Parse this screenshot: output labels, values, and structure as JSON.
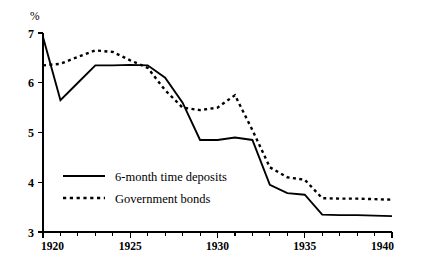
{
  "chart_data": {
    "type": "line",
    "title": "",
    "subtitle": "",
    "xlabel": "",
    "ylabel": "",
    "unit_label": "%",
    "xlim": [
      1920,
      1940
    ],
    "ylim": [
      3,
      7
    ],
    "grid": false,
    "legend_position": "inside-left-lower",
    "x_tick_labels": [
      "1920",
      "1925",
      "1930",
      "1935",
      "1940"
    ],
    "x_tick_values": [
      1920,
      1925,
      1930,
      1935,
      1940
    ],
    "x_minor_tick_values": [
      1921,
      1922,
      1923,
      1924,
      1926,
      1927,
      1928,
      1929,
      1931,
      1932,
      1933,
      1934,
      1936,
      1937,
      1938,
      1939
    ],
    "y_tick_labels": [
      "3",
      "4",
      "5",
      "6",
      "7"
    ],
    "y_tick_values": [
      3,
      4,
      5,
      6,
      7
    ],
    "x": [
      1920,
      1921,
      1922,
      1923,
      1924,
      1925,
      1926,
      1927,
      1928,
      1929,
      1930,
      1931,
      1932,
      1933,
      1934,
      1935,
      1936,
      1937,
      1938,
      1939,
      1940
    ],
    "series": [
      {
        "name": "6-month time deposits",
        "style": "solid",
        "color": "#000000",
        "values": [
          6.92,
          5.65,
          6.0,
          6.35,
          6.35,
          6.36,
          6.35,
          6.1,
          5.6,
          4.85,
          4.85,
          4.9,
          4.85,
          3.95,
          3.78,
          3.75,
          3.35,
          3.34,
          3.34,
          3.33,
          3.32
        ]
      },
      {
        "name": "Government bonds",
        "style": "dotted",
        "color": "#000000",
        "values": [
          6.35,
          6.38,
          6.52,
          6.65,
          6.62,
          6.45,
          6.3,
          5.85,
          5.5,
          5.45,
          5.5,
          5.75,
          5.05,
          4.3,
          4.1,
          4.05,
          3.68,
          3.67,
          3.67,
          3.66,
          3.65
        ]
      }
    ],
    "legend": [
      {
        "label": "6-month time deposits",
        "style": "solid"
      },
      {
        "label": "Government bonds",
        "style": "dotted"
      }
    ]
  },
  "layout": {
    "plot_left": 43,
    "plot_right": 392,
    "plot_top": 33,
    "plot_bottom": 232,
    "legend_x": 63,
    "legend_y_first": 176,
    "legend_y_second": 198,
    "legend_swatch_width": 42,
    "legend_text_x": 115
  }
}
